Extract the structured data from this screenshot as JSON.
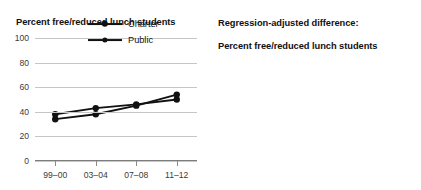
{
  "chart_data": [
    {
      "type": "line",
      "panel": "left",
      "title": "Percent free/reduced lunch students",
      "xlabel": "",
      "ylabel": "",
      "categories": [
        "99–00",
        "03–04",
        "07–08",
        "11–12"
      ],
      "ylim": [
        0,
        100
      ],
      "yticks": [
        0,
        20,
        40,
        60,
        80,
        100
      ],
      "ytick_labels": [
        "0",
        "20",
        "40",
        "60",
        "80",
        "100"
      ],
      "grid": true,
      "legend_position": "upper-right",
      "series": [
        {
          "name": "Charter",
          "values": [
            34,
            38,
            45,
            54
          ],
          "marker": "circle",
          "color": "#111111"
        },
        {
          "name": "Public",
          "values": [
            38,
            43,
            46,
            50
          ],
          "marker": "circle",
          "color": "#111111"
        }
      ]
    },
    {
      "type": "line",
      "panel": "right",
      "title": "Regression-adjusted difference:\nPercent free/reduced lunch students",
      "xlabel": "",
      "ylabel": "",
      "categories": [
        "99–00",
        "03–04",
        "07–08",
        "11–12"
      ],
      "ylim": [
        -30,
        30
      ],
      "yticks": [
        -30,
        -20,
        -10,
        0,
        10,
        20,
        30
      ],
      "ytick_labels": [
        "−30",
        "−20",
        "−10",
        "0",
        "10",
        "20",
        "30"
      ],
      "grid": true,
      "zero_reference_line": {
        "value": 0,
        "style": "dashed"
      },
      "legend_position": "none",
      "series": [
        {
          "name": "Regression-adjusted difference",
          "values": [
            -13,
            -12,
            -5.5,
            -5
          ],
          "significance": [
            "*",
            "*",
            "*",
            "*"
          ],
          "marker": "circle",
          "color": "#111111"
        }
      ]
    }
  ],
  "left_panel": {
    "title": "Percent free/reduced lunch students",
    "ytick_labels": [
      "100",
      "80",
      "60",
      "40",
      "20",
      "0"
    ],
    "xtick_labels": [
      "99–00",
      "03–04",
      "07–08",
      "11–12"
    ],
    "legend": {
      "items": [
        {
          "label": "Charter"
        },
        {
          "label": "Public"
        }
      ]
    }
  },
  "right_panel": {
    "title_line1": "Regression-adjusted difference:",
    "title_line2": "Percent free/reduced lunch students",
    "ytick_labels": [
      "30",
      "20",
      "10",
      "0",
      "−10",
      "−20",
      "−30"
    ],
    "xtick_labels": [
      "99–00",
      "03–04",
      "07–08",
      "11–12"
    ],
    "significance_marks": [
      "*",
      "*",
      "*",
      "*"
    ]
  },
  "colors": {
    "line": "#111111",
    "grid": "#c6c6c6",
    "axis": "#7d7d7d",
    "text": "#1a1a1a",
    "background": "#ffffff"
  }
}
